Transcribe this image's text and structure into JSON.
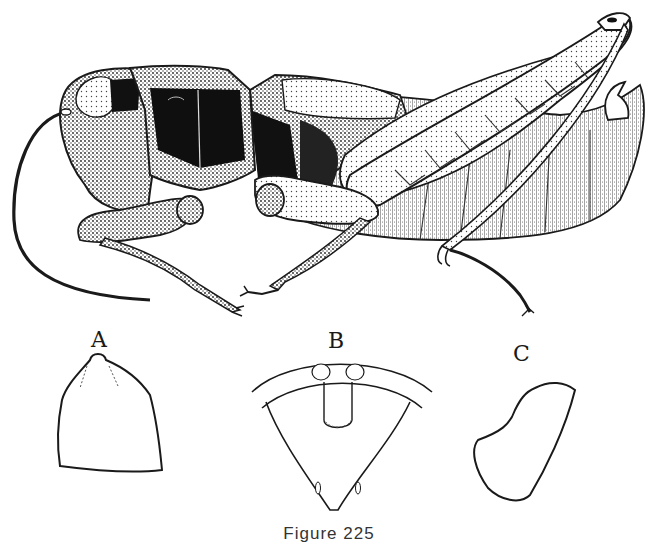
{
  "figure": {
    "main_illustration": "grasshopper-lateral-view",
    "details": [
      {
        "label": "A",
        "shape": "pronotum-outline"
      },
      {
        "label": "B",
        "shape": "sternum-outline"
      },
      {
        "label": "C",
        "shape": "cercus-outline"
      }
    ],
    "caption": "Figure 225"
  },
  "colors": {
    "ink": "#1a1a1a",
    "paper": "#ffffff"
  }
}
